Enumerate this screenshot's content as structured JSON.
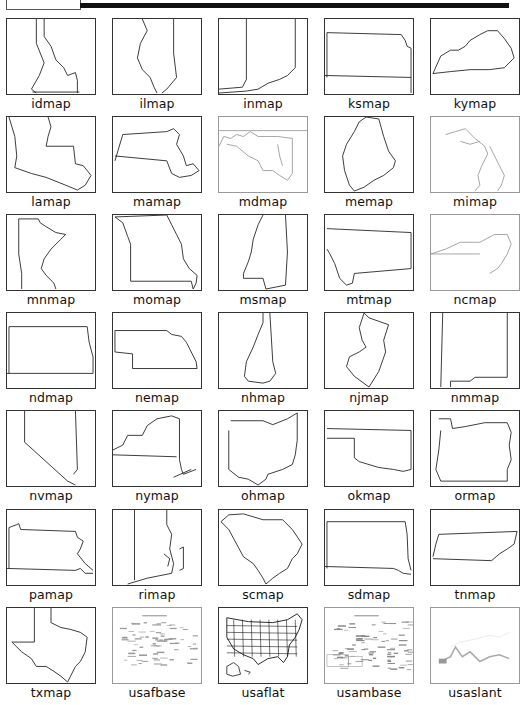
{
  "header": {
    "bar_color": "#111111"
  },
  "maps": [
    {
      "label": "idmap",
      "shape": "id"
    },
    {
      "label": "ilmap",
      "shape": "il"
    },
    {
      "label": "inmap",
      "shape": "in"
    },
    {
      "label": "ksmap",
      "shape": "ks"
    },
    {
      "label": "kymap",
      "shape": "ky"
    },
    {
      "label": "lamap",
      "shape": "la"
    },
    {
      "label": "mamap",
      "shape": "ma"
    },
    {
      "label": "mdmap",
      "shape": "md"
    },
    {
      "label": "memap",
      "shape": "me"
    },
    {
      "label": "mimap",
      "shape": "mi"
    },
    {
      "label": "mnmap",
      "shape": "mn"
    },
    {
      "label": "momap",
      "shape": "mo"
    },
    {
      "label": "msmap",
      "shape": "ms"
    },
    {
      "label": "mtmap",
      "shape": "mt"
    },
    {
      "label": "ncmap",
      "shape": "nc"
    },
    {
      "label": "ndmap",
      "shape": "nd"
    },
    {
      "label": "nemap",
      "shape": "ne"
    },
    {
      "label": "nhmap",
      "shape": "nh"
    },
    {
      "label": "njmap",
      "shape": "nj"
    },
    {
      "label": "nmmap",
      "shape": "nm"
    },
    {
      "label": "nvmap",
      "shape": "nv"
    },
    {
      "label": "nymap",
      "shape": "ny"
    },
    {
      "label": "ohmap",
      "shape": "oh"
    },
    {
      "label": "okmap",
      "shape": "ok"
    },
    {
      "label": "ormap",
      "shape": "or"
    },
    {
      "label": "pamap",
      "shape": "pa"
    },
    {
      "label": "rimap",
      "shape": "ri"
    },
    {
      "label": "scmap",
      "shape": "sc"
    },
    {
      "label": "sdmap",
      "shape": "sd"
    },
    {
      "label": "tnmap",
      "shape": "tn"
    },
    {
      "label": "txmap",
      "shape": "tx"
    },
    {
      "label": "usafbase",
      "shape": "usafbase"
    },
    {
      "label": "usaflat",
      "shape": "usaflat"
    },
    {
      "label": "usambase",
      "shape": "usambase"
    },
    {
      "label": "usaslant",
      "shape": "usaslant"
    }
  ]
}
